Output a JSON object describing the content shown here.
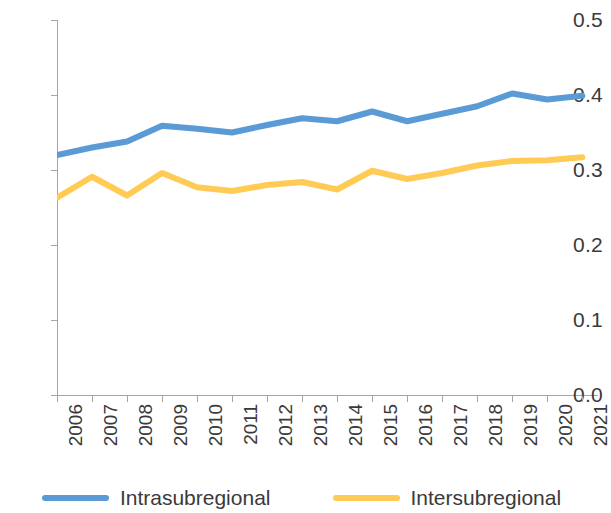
{
  "chart_data": {
    "type": "line",
    "title": "",
    "subtitle": "",
    "xlabel": "",
    "ylabel": "",
    "categories": [
      "2006",
      "2007",
      "2008",
      "2009",
      "2010",
      "2011",
      "2012",
      "2013",
      "2014",
      "2015",
      "2016",
      "2017",
      "2018",
      "2019",
      "2020",
      "2021"
    ],
    "x": [
      2006,
      2007,
      2008,
      2009,
      2010,
      2011,
      2012,
      2013,
      2014,
      2015,
      2016,
      2017,
      2018,
      2019,
      2020,
      2021
    ],
    "series": [
      {
        "name": "Intrasubregional",
        "color": "#5B9BD5",
        "values": [
          0.32,
          0.33,
          0.338,
          0.359,
          0.355,
          0.35,
          0.36,
          0.369,
          0.365,
          0.378,
          0.365,
          0.375,
          0.385,
          0.402,
          0.394,
          0.399
        ]
      },
      {
        "name": "Intersubregional",
        "color": "#FFCB54",
        "values": [
          0.263,
          0.291,
          0.266,
          0.296,
          0.277,
          0.272,
          0.28,
          0.284,
          0.274,
          0.299,
          0.288,
          0.296,
          0.306,
          0.312,
          0.313,
          0.317
        ]
      }
    ],
    "ylim": [
      0.0,
      0.5
    ],
    "ytick_labels": [
      "0.0",
      "0.1",
      "0.2",
      "0.3",
      "0.4",
      "0.5"
    ],
    "ytick_values": [
      0.0,
      0.1,
      0.2,
      0.3,
      0.4,
      0.5
    ],
    "grid": false,
    "legend_position": "bottom",
    "axis_color": "#a6a6a6",
    "text_color": "#3a3a3a"
  },
  "legend": {
    "items": [
      {
        "label": "Intrasubregional",
        "color": "#5B9BD5"
      },
      {
        "label": "Intersubregional",
        "color": "#FFCB54"
      }
    ]
  }
}
